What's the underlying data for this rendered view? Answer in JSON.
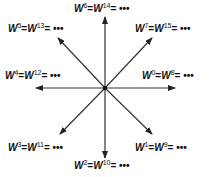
{
  "diagram": {
    "title": "",
    "center": {
      "x": 105,
      "y": 88
    },
    "arrows": [
      {
        "name": "arrow-0",
        "x2": 175,
        "y2": 88
      },
      {
        "name": "arrow-1",
        "x2": 152,
        "y2": 134
      },
      {
        "name": "arrow-2",
        "x2": 105,
        "y2": 158
      },
      {
        "name": "arrow-3",
        "x2": 60,
        "y2": 134
      },
      {
        "name": "arrow-4",
        "x2": 36,
        "y2": 88
      },
      {
        "name": "arrow-5",
        "x2": 58,
        "y2": 38
      },
      {
        "name": "arrow-6",
        "x2": 105,
        "y2": 17
      },
      {
        "name": "arrow-7",
        "x2": 152,
        "y2": 38
      }
    ],
    "labels": [
      {
        "id": "w0",
        "base": "W",
        "e1": "0",
        "e2": "8",
        "eq": "=",
        "tail": "= •••",
        "x": 142,
        "y": 71
      },
      {
        "id": "w1",
        "base": "W",
        "e1": "1",
        "e2": "9",
        "eq": "=",
        "tail": "= •••",
        "x": 135,
        "y": 143
      },
      {
        "id": "w2",
        "base": "W",
        "e1": "2",
        "e2": "10",
        "eq": "=",
        "tail": "= •••",
        "x": 74,
        "y": 161
      },
      {
        "id": "w3",
        "base": "W",
        "e1": "3",
        "e2": "11",
        "eq": "=",
        "tail": "= •••",
        "x": 8,
        "y": 143
      },
      {
        "id": "w4",
        "base": "W",
        "e1": "4",
        "e2": "12",
        "eq": "=",
        "tail": "= •••",
        "x": 5,
        "y": 71
      },
      {
        "id": "w5",
        "base": "W",
        "e1": "5",
        "e2": "13",
        "eq": "=",
        "tail": "= •••",
        "x": 8,
        "y": 24
      },
      {
        "id": "w6",
        "base": "W",
        "e1": "6",
        "e2": "14",
        "eq": "=",
        "tail": "= •••",
        "x": 74,
        "y": 4
      },
      {
        "id": "w7",
        "base": "W",
        "e1": "7",
        "e2": "15",
        "eq": "=",
        "tail": "= •••",
        "x": 135,
        "y": 24
      }
    ],
    "colors": {
      "line": "#333333",
      "text": "#111111",
      "background": "#ffffff"
    }
  }
}
